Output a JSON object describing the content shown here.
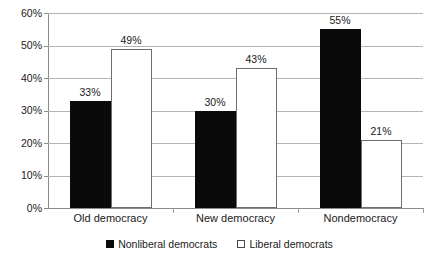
{
  "chart_data": {
    "type": "bar",
    "title": "",
    "xlabel": "",
    "ylabel": "",
    "categories": [
      "Old democracy",
      "New democracy",
      "Nondemocracy"
    ],
    "series": [
      {
        "name": "Nonliberal democrats",
        "color": "#0a0a0a",
        "values": [
          33,
          30,
          55
        ],
        "labels": [
          "33%",
          "30%",
          "55%"
        ]
      },
      {
        "name": "Liberal democrats",
        "color": "#ffffff",
        "values": [
          49,
          43,
          21
        ],
        "labels": [
          "49%",
          "43%",
          "21%"
        ]
      }
    ],
    "ylim": [
      0,
      60
    ],
    "ytick_values": [
      0,
      10,
      20,
      30,
      40,
      50,
      60
    ],
    "ytick_labels": [
      "0%",
      "10%",
      "20%",
      "30%",
      "40%",
      "50%",
      "60%"
    ],
    "grid": true,
    "legend_position": "bottom"
  },
  "legend": {
    "items": [
      {
        "label": "Nonliberal democrats",
        "marker": "filled-square-icon"
      },
      {
        "label": "Liberal democrats",
        "marker": "outlined-square-icon"
      }
    ]
  }
}
